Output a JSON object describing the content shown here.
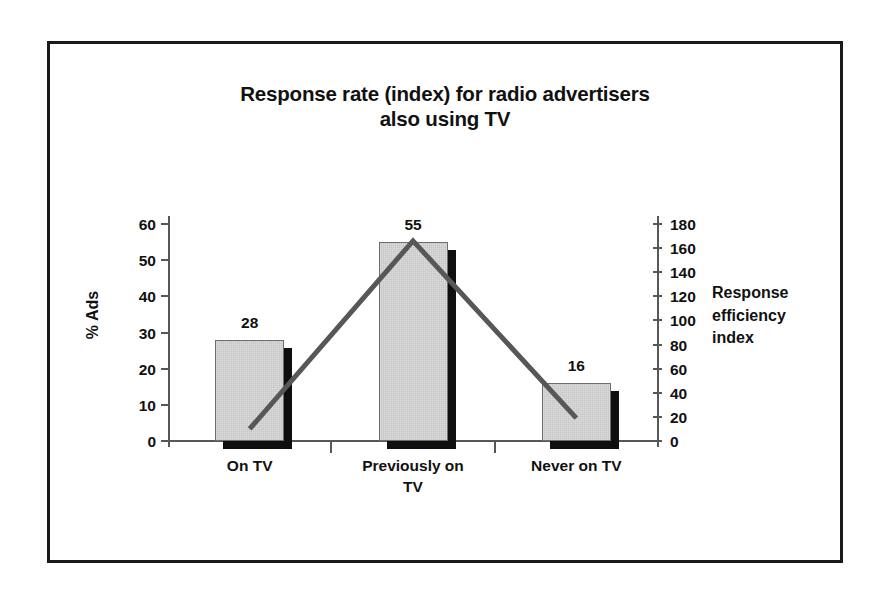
{
  "chart_data": {
    "type": "bar",
    "title": "Response rate (index) for radio advertisers also using TV",
    "title_line1": "Response rate (index) for radio advertisers",
    "title_line2": "also using TV",
    "categories": [
      "On TV",
      "Previously on TV",
      "Never on TV"
    ],
    "category_lines": [
      [
        "On TV"
      ],
      [
        "Previously on",
        "TV"
      ],
      [
        "Never on TV"
      ]
    ],
    "series": [
      {
        "name": "% Ads",
        "type": "bar",
        "axis": "left",
        "values": [
          28,
          55,
          16
        ],
        "labels": [
          "28",
          "55",
          "16"
        ],
        "color": "#c6c6c6"
      },
      {
        "name": "Response efficiency index",
        "type": "line",
        "axis": "right",
        "values": [
          10,
          166,
          19
        ],
        "color": "#575757"
      }
    ],
    "xlabel": "",
    "ylabel": "% Ads",
    "ylabel_right": "Response efficiency index",
    "ylabel_right_lines": [
      "Response",
      "efficiency",
      "index"
    ],
    "ylim": [
      0,
      60
    ],
    "ylim_right": [
      0,
      180
    ],
    "yticks": [
      0,
      10,
      20,
      30,
      40,
      50,
      60
    ],
    "ytick_labels": [
      "0",
      "10",
      "20",
      "30",
      "40",
      "50",
      "60"
    ],
    "yticks_right": [
      0,
      20,
      40,
      60,
      80,
      100,
      120,
      140,
      160,
      180
    ],
    "ytick_labels_right": [
      "0",
      "20",
      "40",
      "60",
      "80",
      "100",
      "120",
      "140",
      "160",
      "180"
    ],
    "grid": false,
    "legend": "none",
    "frame": true,
    "colors": {
      "bar_fill": "#c6c6c6",
      "bar_shadow": "#100f0f",
      "axis": "#575757",
      "line": "#575757",
      "text": "#111111",
      "frame": "#1a1a1a",
      "background": "#ffffff"
    }
  }
}
